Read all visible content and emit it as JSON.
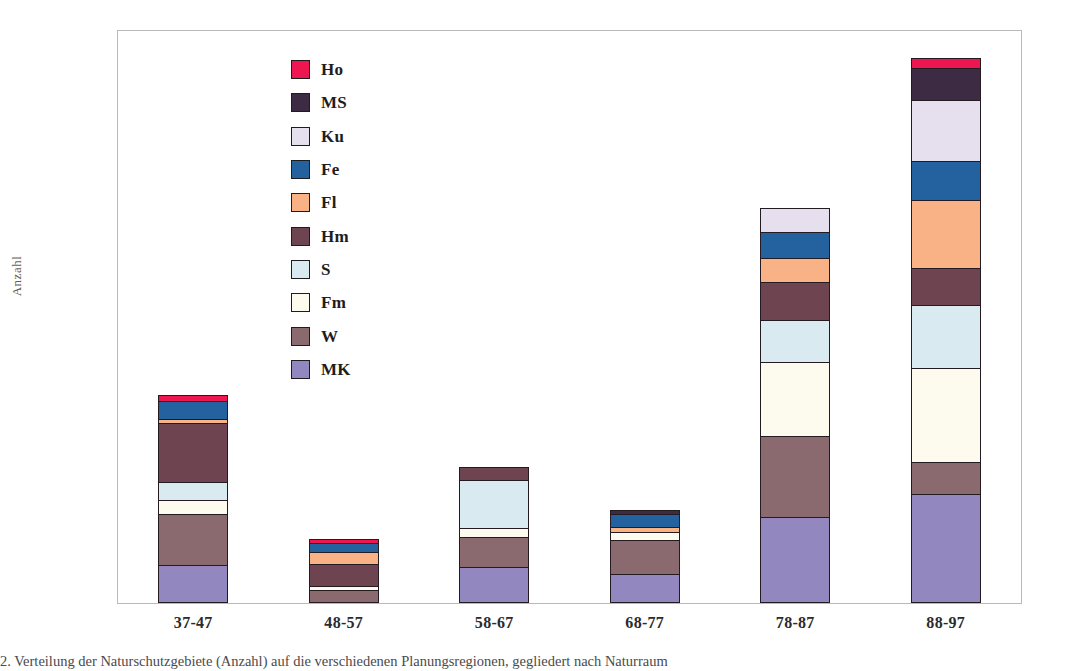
{
  "figure": {
    "y_axis_title": "Anzahl",
    "caption": "2. Verteilung der Naturschutzgebiete (Anzahl) auf die verschiedenen Planungsregionen, gegliedert nach Naturraum"
  },
  "legend": {
    "position": "inside-top-left",
    "entries": [
      {
        "label": "Ho",
        "color": "#ED1651"
      },
      {
        "label": "MS",
        "color": "#3C2B43"
      },
      {
        "label": "Ku",
        "color": "#E6E0EE"
      },
      {
        "label": "Fe",
        "color": "#23619F"
      },
      {
        "label": "Fl",
        "color": "#F8B286"
      },
      {
        "label": "Hm",
        "color": "#6E4450"
      },
      {
        "label": "S",
        "color": "#D9EAF0"
      },
      {
        "label": "Fm",
        "color": "#FDFBEE"
      },
      {
        "label": "W",
        "color": "#8A6A6E"
      },
      {
        "label": "MK",
        "color": "#9287BE"
      }
    ]
  },
  "chart_data": {
    "type": "bar",
    "subtype": "stacked-bar",
    "title": "",
    "xlabel": "",
    "ylabel": "Anzahl",
    "ylim": [
      0,
      90
    ],
    "ytick_step": 10,
    "yticks": [
      0,
      10,
      20,
      30,
      40,
      50,
      60,
      70,
      80,
      90
    ],
    "grid": false,
    "categories": [
      "37-47",
      "48-57",
      "58-67",
      "68-77",
      "78-87",
      "88-97"
    ],
    "series": [
      {
        "name": "MK",
        "color": "#9287BE",
        "values": [
          6.0,
          0.0,
          5.6,
          4.6,
          13.5,
          17.2
        ]
      },
      {
        "name": "W",
        "color": "#8A6A6E",
        "values": [
          8.2,
          2.0,
          5.0,
          5.4,
          12.9,
          5.2
        ]
      },
      {
        "name": "Fm",
        "color": "#FDFBEE",
        "values": [
          2.3,
          0.8,
          1.6,
          1.5,
          11.8,
          14.9
        ]
      },
      {
        "name": "S",
        "color": "#D9EAF0",
        "values": [
          3.0,
          0.0,
          7.7,
          0.0,
          6.8,
          10.0
        ]
      },
      {
        "name": "Hm",
        "color": "#6E4450",
        "values": [
          9.5,
          3.6,
          2.1,
          0.0,
          6.1,
          6.1
        ]
      },
      {
        "name": "Fl",
        "color": "#F8B286",
        "values": [
          0.8,
          2.1,
          0.0,
          0.9,
          4.0,
          10.8
        ]
      },
      {
        "name": "Fe",
        "color": "#23619F",
        "values": [
          3.0,
          1.6,
          0.0,
          2.3,
          4.2,
          6.3
        ]
      },
      {
        "name": "Ku",
        "color": "#E6E0EE",
        "values": [
          0.0,
          0.0,
          0.0,
          0.0,
          3.9,
          9.8
        ]
      },
      {
        "name": "MS",
        "color": "#3C2B43",
        "values": [
          0.0,
          0.0,
          0.0,
          0.8,
          0.0,
          5.2
        ]
      },
      {
        "name": "Ho",
        "color": "#ED1651",
        "values": [
          1.0,
          0.8,
          0.0,
          0.0,
          0.0,
          1.7
        ]
      }
    ],
    "totals": [
      33.8,
      10.9,
      22.0,
      15.5,
      63.2,
      87.2
    ]
  }
}
